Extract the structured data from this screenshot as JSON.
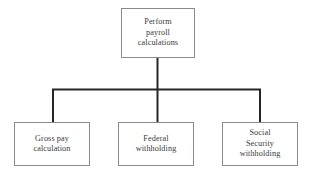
{
  "diagram": {
    "type": "hierarchy-tree",
    "orientation": "top-down",
    "canvas": {
      "width": 316,
      "height": 181,
      "background": "#ffffff"
    },
    "style": {
      "box_border_color": "#8a8a8a",
      "box_fill_color": "#ffffff",
      "connector_color": "#262626",
      "text_color": "#3a3a3a"
    },
    "root": {
      "id": "perform-payroll-calculations",
      "label": "Perform\npayroll\ncalculations",
      "lines": [
        "Perform",
        "payroll",
        "calculations"
      ]
    },
    "children": [
      {
        "id": "gross-pay-calculation",
        "label": "Gross pay\ncalculation",
        "lines": [
          "Gross pay",
          "calculation"
        ]
      },
      {
        "id": "federal-withholding",
        "label": "Federal\nwithholding",
        "lines": [
          "Federal",
          "withholding"
        ]
      },
      {
        "id": "social-security-withholding",
        "label": "Social\nSecurity\nwithholding",
        "lines": [
          "Social",
          "Security",
          "withholding"
        ]
      }
    ],
    "connectors": [
      {
        "id": "root-stem",
        "from": "perform-payroll-calculations",
        "to": "bus"
      },
      {
        "id": "bus",
        "orientation": "horizontal"
      },
      {
        "id": "drop-left",
        "to": "gross-pay-calculation"
      },
      {
        "id": "drop-middle",
        "to": "federal-withholding"
      },
      {
        "id": "drop-right",
        "to": "social-security-withholding"
      }
    ]
  }
}
